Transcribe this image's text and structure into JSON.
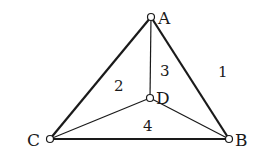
{
  "diagram": {
    "type": "planar-graph",
    "nodes": [
      {
        "id": "A",
        "label": "A",
        "x": 151,
        "y": 17
      },
      {
        "id": "B",
        "label": "B",
        "x": 229,
        "y": 139
      },
      {
        "id": "C",
        "label": "C",
        "x": 50,
        "y": 139
      },
      {
        "id": "D",
        "label": "D",
        "x": 150,
        "y": 98
      }
    ],
    "edges": [
      {
        "from": "A",
        "to": "C",
        "weight": "thick"
      },
      {
        "from": "A",
        "to": "B",
        "weight": "thick"
      },
      {
        "from": "C",
        "to": "B",
        "weight": "thick"
      },
      {
        "from": "A",
        "to": "D",
        "weight": "thin"
      },
      {
        "from": "C",
        "to": "D",
        "weight": "thin"
      },
      {
        "from": "D",
        "to": "B",
        "weight": "thin"
      }
    ],
    "regions": [
      {
        "label": "1",
        "x": 224,
        "y": 77
      },
      {
        "label": "2",
        "x": 120,
        "y": 91
      },
      {
        "label": "3",
        "x": 166,
        "y": 76
      },
      {
        "label": "4",
        "x": 148,
        "y": 131
      }
    ]
  }
}
